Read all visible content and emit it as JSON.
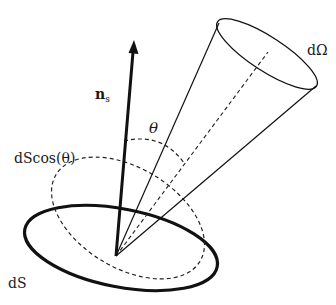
{
  "diagram": {
    "type": "solid-angle-projection",
    "labels": {
      "normal": "n",
      "normal_subscript": "s",
      "angle": "θ",
      "projected_area": "dScos(θ)",
      "solid_angle": "dΩ",
      "surface": "dS"
    },
    "colors": {
      "stroke": "#111111",
      "background": "#ffffff"
    }
  }
}
